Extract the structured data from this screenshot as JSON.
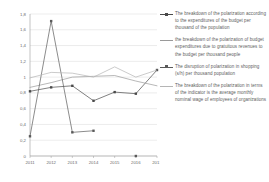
{
  "chart_data": {
    "type": "line",
    "title": "",
    "xlabel": "",
    "ylabel": "",
    "categories": [
      "2011",
      "2012",
      "2013",
      "2014",
      "2015",
      "2016",
      "2017"
    ],
    "x": [
      2011,
      2012,
      2013,
      2014,
      2015,
      2016,
      2017
    ],
    "ylim": [
      0,
      1.8
    ],
    "ytick_labels": [
      "0",
      "0,2",
      "0,4",
      "0,6",
      "0,8",
      "1",
      "1,2",
      "1,4",
      "1,6",
      "1,8"
    ],
    "ytick_values": [
      0,
      0.2,
      0.4,
      0.6,
      0.8,
      1.0,
      1.2,
      1.4,
      1.6,
      1.8
    ],
    "grid": true,
    "grid_axis": "y",
    "legend_position": "right",
    "series": [
      {
        "name": "The breakdown of the polarization according to the expenditures of the budget per thousand of the population",
        "short_name": "budget-expenditures-per-thousand",
        "color": "#4a4a4a",
        "marker": "square",
        "values": [
          0.82,
          0.87,
          0.89,
          0.7,
          0.81,
          0.79,
          1.09
        ]
      },
      {
        "name": "the breakdown of the polarization of budget expenditures due to gratuitous revenues to the budget per thousand people",
        "short_name": "gratuitous-revenues-per-thousand",
        "color": "#9a9a9a",
        "marker": "none",
        "values": [
          0.87,
          0.93,
          1.0,
          1.01,
          1.02,
          0.95,
          0.89
        ]
      },
      {
        "name": "The disruption of polarization in shopping (s/h) per thousand population",
        "short_name": "shopping-per-thousand-population",
        "color": "#5a5a5a",
        "marker": "square",
        "values": [
          0.25,
          1.71,
          0.3,
          0.32,
          null,
          0.0,
          null
        ]
      },
      {
        "name": "The breakdown of the polarization in terms of the indicator is the average monthly nominal wage of employees of organizations",
        "short_name": "average-monthly-nominal-wage",
        "color": "#b5b5b5",
        "marker": "none",
        "values": [
          0.99,
          1.06,
          1.05,
          1.0,
          1.13,
          1.0,
          1.09
        ]
      }
    ]
  },
  "axes": {
    "y_labels": [
      "1,8",
      "1,6",
      "1,4",
      "1,2",
      "1",
      "0,8",
      "0,6",
      "0,4",
      "0,2",
      "0"
    ],
    "x_labels": [
      "2011",
      "2012",
      "2013",
      "2014",
      "2015",
      "2016",
      "2017"
    ]
  },
  "legend": {
    "items": [
      {
        "label": "The breakdown of the polarization according to the expenditures of the budget per thousand of the population",
        "color": "#4a4a4a",
        "marker": "square"
      },
      {
        "label": "the breakdown of the polarization of budget expenditures due to gratuitous revenues to the budget per thousand people",
        "color": "#9a9a9a",
        "marker": "none"
      },
      {
        "label": "The disruption of polarization in shopping (s/h) per thousand population",
        "color": "#5a5a5a",
        "marker": "square"
      },
      {
        "label": "The breakdown of the polarization in terms of the indicator is the average monthly nominal wage of employees of organizations",
        "color": "#b5b5b5",
        "marker": "none"
      }
    ]
  },
  "colors": {
    "grid": "#d8d8d8",
    "axis": "#9b9b9b",
    "tick_text": "#6b6b6b",
    "legend_text": "#5d5d5d",
    "background": "#ffffff"
  }
}
